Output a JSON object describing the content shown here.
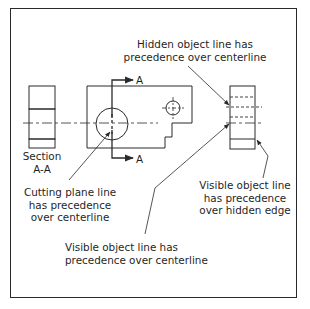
{
  "callouts": {
    "hidden_over_center": [
      "Hidden object line has",
      "precedence over centerline"
    ],
    "cutting_plane": [
      "Cutting plane line",
      "has precedence",
      "over centerline"
    ],
    "visible_over_hidden": [
      "Visible object line",
      "has precedence",
      "over hidden edge"
    ],
    "visible_over_center": [
      "Visible object line has",
      "precedence over centerline"
    ]
  },
  "section_label": [
    "Section",
    "A-A"
  ],
  "cutting_plane_letters": {
    "top": "A",
    "bottom": "A"
  },
  "colors": {
    "line": "#2a2a2a",
    "text": "#1f1f1f",
    "background": "#ffffff"
  }
}
